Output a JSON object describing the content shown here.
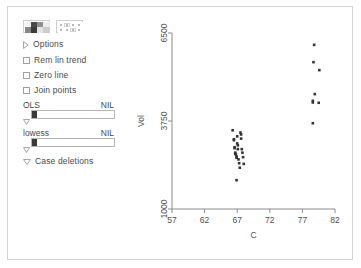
{
  "panel": {
    "background": "#ffffff",
    "border_color": "#d3d3d3"
  },
  "sidebar": {
    "toolbar": {
      "buttons": [
        {
          "name": "grid-pattern-icon",
          "label": ""
        },
        {
          "name": "dotted-grid-icon",
          "label": ""
        }
      ]
    },
    "options_label": "Options",
    "checkboxes": [
      {
        "label": "Rem lin trend",
        "checked": false
      },
      {
        "label": "Zero line",
        "checked": false
      },
      {
        "label": "Join points",
        "checked": false
      }
    ],
    "sliders": [
      {
        "label": "OLS",
        "value_label": "NIL",
        "fill_fraction": 0.06
      },
      {
        "label": "lowess",
        "value_label": "NIL",
        "fill_fraction": 0.06
      }
    ],
    "case_deletions_label": "Case deletions"
  },
  "chart_data": {
    "type": "scatter",
    "title": "",
    "xlabel": "C",
    "ylabel": "Vol",
    "xlim": [
      57,
      82
    ],
    "ylim": [
      1000,
      6500
    ],
    "xticks": [
      57,
      62,
      67,
      72,
      77,
      82
    ],
    "yticks": [
      1000,
      3750,
      6500
    ],
    "grid": false,
    "legend": null,
    "marker_color": "#333333",
    "marker_size": 2.6,
    "series": [
      {
        "name": "Vol vs C",
        "points": [
          [
            66.3,
            3460
          ],
          [
            66.5,
            3180
          ],
          [
            66.5,
            3150
          ],
          [
            66.6,
            2930
          ],
          [
            66.6,
            2900
          ],
          [
            66.7,
            2760
          ],
          [
            66.7,
            2730
          ],
          [
            66.8,
            2700
          ],
          [
            66.9,
            2640
          ],
          [
            66.9,
            2600
          ],
          [
            67.0,
            3270
          ],
          [
            67.0,
            3050
          ],
          [
            67.1,
            2990
          ],
          [
            67.1,
            2870
          ],
          [
            67.2,
            2550
          ],
          [
            67.3,
            2430
          ],
          [
            67.4,
            2290
          ],
          [
            67.5,
            3390
          ],
          [
            67.6,
            3330
          ],
          [
            67.6,
            3200
          ],
          [
            67.7,
            2870
          ],
          [
            67.8,
            2760
          ],
          [
            67.9,
            2620
          ],
          [
            68.0,
            2410
          ],
          [
            66.9,
            1900
          ],
          [
            78.8,
            6130
          ],
          [
            78.7,
            5590
          ],
          [
            79.6,
            5340
          ],
          [
            78.9,
            4590
          ],
          [
            78.6,
            4380
          ],
          [
            78.6,
            4330
          ],
          [
            79.5,
            4320
          ],
          [
            78.6,
            3680
          ]
        ]
      }
    ]
  }
}
